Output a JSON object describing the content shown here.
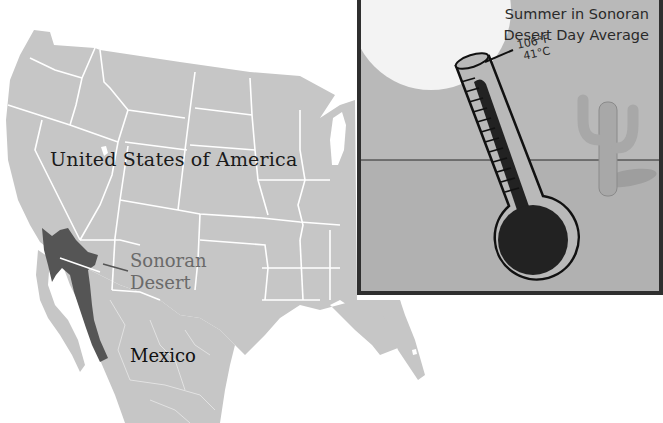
{
  "map": {
    "labels": {
      "country_usa": "United States of America",
      "region_line1": "Sonoran",
      "region_line2": "Desert",
      "country_mexico": "Mexico"
    },
    "colors": {
      "land": "#c6c6c6",
      "borders": "#ffffff",
      "sonoran_desert": "#555555",
      "water": "#ffffff"
    }
  },
  "inset": {
    "title_line1": "Summer in Sonoran",
    "title_line2": "Desert Day Average",
    "temp_f": "106°F",
    "temp_c": "41°C",
    "icons": [
      "sun-icon",
      "thermometer-icon",
      "cactus-icon"
    ],
    "colors": {
      "frame": "#2f2f2f",
      "sky": "#b9b9b9",
      "ground": "#b0b0b0",
      "sun": "#f2f2f2",
      "mercury": "#2a2a2a"
    }
  }
}
